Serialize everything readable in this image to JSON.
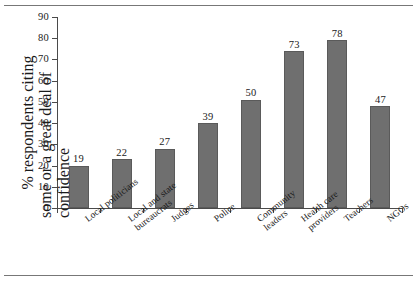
{
  "chart_data": {
    "type": "bar",
    "title": "",
    "xlabel": "",
    "ylabel_lines": [
      "% respondents citing",
      "some or a great deal of confidence"
    ],
    "categories": [
      "Local politicians",
      "Local and state bureaucrats",
      "Judges",
      "Police",
      "Community leaders",
      "Health care providers",
      "Teachers",
      "NGOs"
    ],
    "category_lines": [
      [
        "Local politicians"
      ],
      [
        "Local and state",
        "bureaucrats"
      ],
      [
        "Judges"
      ],
      [
        "Police"
      ],
      [
        "Community",
        "leaders"
      ],
      [
        "Health care",
        "providers"
      ],
      [
        "Teachers"
      ],
      [
        "NGOs"
      ]
    ],
    "values": [
      19,
      22,
      27,
      39,
      50,
      73,
      78,
      47
    ],
    "value_labels": [
      "19",
      "22",
      "27",
      "39",
      "50",
      "73",
      "78",
      "47"
    ],
    "ylim": [
      0,
      90
    ],
    "yticks": [
      0,
      10,
      20,
      30,
      40,
      50,
      60,
      70,
      80,
      90
    ],
    "ytick_labels": [
      "0",
      "10",
      "20",
      "30",
      "40",
      "50",
      "60",
      "70",
      "80",
      "90"
    ],
    "grid": false,
    "legend": false,
    "bar_color": "#6f6f6f",
    "axis_color": "#4a4a4a",
    "background": "#ffffff"
  }
}
